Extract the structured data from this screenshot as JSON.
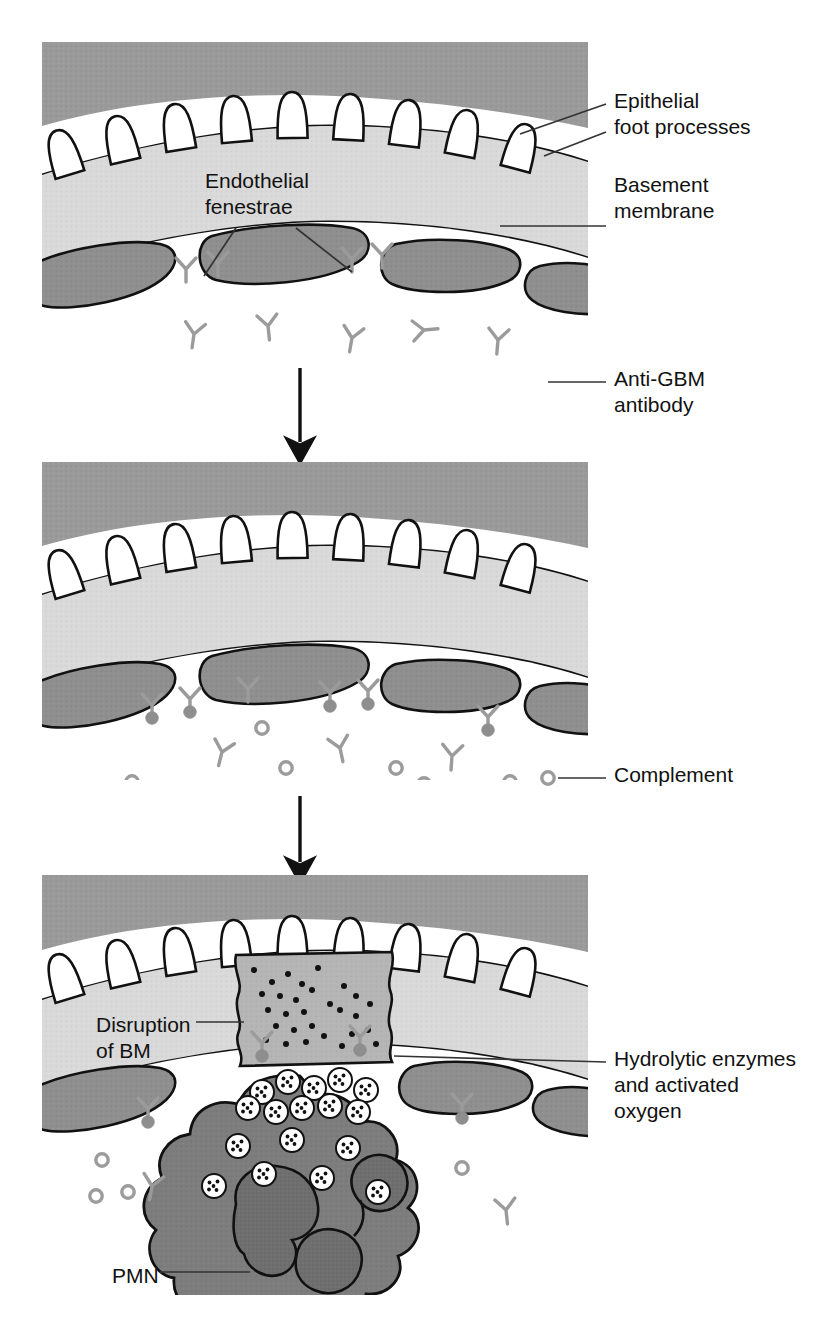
{
  "figure": {
    "domain": "biomedical-illustration",
    "style": "grayscale line drawing, three sequential panels with downward arrows"
  },
  "colors": {
    "epithelium_gray": "#9a9a9a",
    "basement_membrane_gray": "#d9d9d9",
    "endothelial_gray": "#8f8f8f",
    "pmn_gray": "#7d7d7d",
    "pmn_nucleus_gray": "#6f6f6f",
    "disruption_gray": "#b5b5b5",
    "antibody_gray": "#9b9b9b",
    "complement_gray": "#9b9b9b",
    "outline_black": "#111111",
    "white": "#ffffff",
    "leader_line": "#333333",
    "text": "#111111"
  },
  "panels": [
    {
      "id": "panel-1",
      "order": 1,
      "caption": "Normal glomerular capillary wall with circulating anti-GBM antibody",
      "bounds": {
        "x": 42,
        "y": 42,
        "width": 546,
        "height": 318
      },
      "layers": [
        "epithelial foot processes",
        "basement membrane",
        "endothelial cells",
        "capillary lumen"
      ],
      "features": {
        "foot_process_count": 9,
        "endothelial_cell_count": 5,
        "free_antibody_count": 5,
        "bound_antibody_count": 4,
        "complement_count": 0
      }
    },
    {
      "id": "panel-2",
      "order": 2,
      "caption": "Anti-GBM antibody bound along the basement membrane with complement fixation",
      "bounds": {
        "x": 42,
        "y": 462,
        "width": 546,
        "height": 318
      },
      "layers": [
        "epithelial foot processes",
        "basement membrane",
        "endothelial cells",
        "capillary lumen"
      ],
      "features": {
        "foot_process_count": 9,
        "endothelial_cell_count": 5,
        "free_antibody_count": 4,
        "bound_antibody_count": 6,
        "complement_count": 14
      }
    },
    {
      "id": "panel-3",
      "order": 3,
      "caption": "Neutrophil recruitment, degranulation and disruption of the basement membrane",
      "bounds": {
        "x": 42,
        "y": 875,
        "width": 546,
        "height": 420
      },
      "layers": [
        "epithelial foot processes",
        "basement membrane",
        "disrupted basement membrane",
        "endothelial cells",
        "PMN",
        "capillary lumen"
      ],
      "features": {
        "foot_process_count": 9,
        "endothelial_cell_count": 5,
        "free_antibody_count": 2,
        "bound_antibody_count": 4,
        "complement_count": 4,
        "granule_count": 17,
        "pmn_nucleus_lobes": 3
      }
    }
  ],
  "arrows": [
    {
      "id": "arrow-1",
      "from_panel": "panel-1",
      "to_panel": "panel-2",
      "direction": "down",
      "x": 300,
      "y_start": 368,
      "y_end": 452
    },
    {
      "id": "arrow-2",
      "from_panel": "panel-2",
      "to_panel": "panel-3",
      "direction": "down",
      "x": 300,
      "y_start": 788,
      "y_end": 868
    }
  ],
  "labels": {
    "epithelial_foot_processes": {
      "text": "Epithelial\nfoot processes",
      "lines": [
        "Epithelial",
        "foot processes"
      ],
      "x": 614,
      "y": 88,
      "leaders": 2
    },
    "endothelial_fenestrae": {
      "text": "Endothelial\nfenestrae",
      "lines": [
        "Endothelial",
        "fenestrae"
      ],
      "x": 205,
      "y": 168,
      "leaders": 2
    },
    "basement_membrane": {
      "text": "Basement\nmembrane",
      "lines": [
        "Basement",
        "membrane"
      ],
      "x": 614,
      "y": 172,
      "leaders": 1
    },
    "anti_gbm_antibody": {
      "text": "Anti-GBM\nantibody",
      "lines": [
        "Anti-GBM",
        "antibody"
      ],
      "x": 614,
      "y": 366,
      "leaders": 1
    },
    "complement": {
      "text": "Complement",
      "lines": [
        "Complement"
      ],
      "x": 614,
      "y": 762,
      "leaders": 1
    },
    "disruption_of_bm": {
      "text": "Disruption\nof BM",
      "lines": [
        "Disruption",
        "of BM"
      ],
      "x": 96,
      "y": 1012,
      "leaders": 1
    },
    "hydrolytic_enzymes": {
      "text": "Hydrolytic enzymes\nand activated\noxygen",
      "lines": [
        "Hydrolytic enzymes",
        "and activated",
        "oxygen"
      ],
      "x": 614,
      "y": 1046,
      "leaders": 1
    },
    "pmn": {
      "text": "PMN",
      "lines": [
        "PMN"
      ],
      "x": 112,
      "y": 1263,
      "leaders": 1
    }
  }
}
